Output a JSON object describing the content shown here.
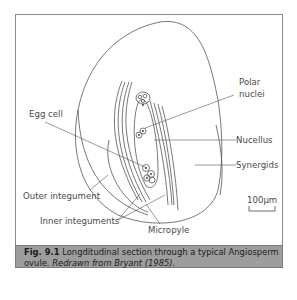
{
  "figure": {
    "labels": {
      "polar_nuclei_line1": "Polar",
      "polar_nuclei_line2": "nuclei",
      "egg_cell": "Egg cell",
      "nucellus": "Nucellus",
      "synergids": "Synergids",
      "outer_integument": "Outer integument",
      "inner_integuments": "Inner integuments",
      "micropyle": "Micropyle",
      "scale_bar": "100µm"
    },
    "caption": {
      "number": "Fig. 9.1",
      "text": "Longditudinal section through a typical Angiosperm ovule.",
      "credit": "Redrawn from Bryant (1985)."
    },
    "colors": {
      "line": "#555555",
      "caption_bg": "#9d9d9d",
      "frame": "#8a8a8a"
    }
  }
}
